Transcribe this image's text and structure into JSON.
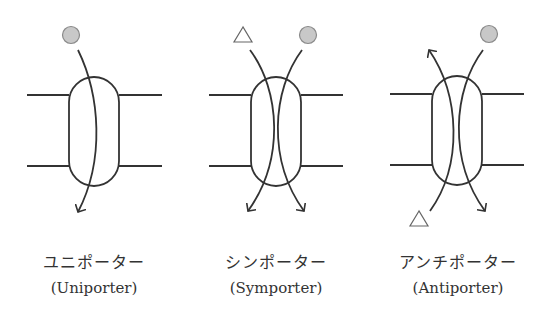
{
  "colors": {
    "stroke": "#333333",
    "circle_fill": "#c8c8c8",
    "circle_stroke": "#8a8a8a",
    "triangle_stroke": "#666666",
    "background": "#ffffff"
  },
  "panels": [
    {
      "name": "uniporter",
      "label_jp": "ユニポーター",
      "label_en": "(Uniporter)",
      "molecules": [
        "circle"
      ],
      "direction": "circle moves down through carrier"
    },
    {
      "name": "symporter",
      "label_jp": "シンポーター",
      "label_en": "(Symporter)",
      "molecules": [
        "triangle",
        "circle"
      ],
      "direction": "both move down through carrier"
    },
    {
      "name": "antiporter",
      "label_jp": "アンチポーター",
      "label_en": "(Antiporter)",
      "molecules": [
        "circle",
        "triangle"
      ],
      "direction": "circle moves down, triangle moves up"
    }
  ]
}
